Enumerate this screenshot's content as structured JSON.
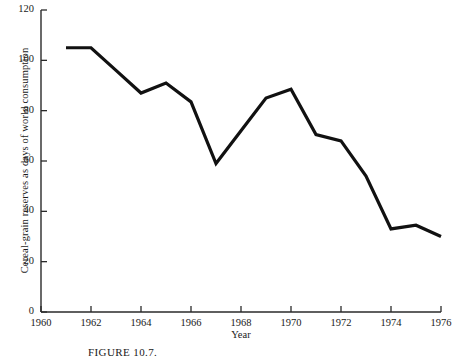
{
  "caption": "FIGURE 10.7.",
  "chart_data": {
    "type": "line",
    "title": "",
    "xlabel": "Year",
    "ylabel": "Cereal-grain reserves as days of world consumption",
    "xlim": [
      1960,
      1976
    ],
    "ylim": [
      0,
      120
    ],
    "grid": false,
    "legend": null,
    "xticks": [
      1960,
      1962,
      1964,
      1966,
      1968,
      1970,
      1972,
      1974,
      1976
    ],
    "xtick_labels": [
      "1960",
      "1962",
      "1964",
      "1966",
      "1968",
      "1970",
      "1972",
      "1974",
      "1976"
    ],
    "yticks": [
      0,
      20,
      40,
      60,
      80,
      100,
      120
    ],
    "ytick_labels": [
      "0",
      "20",
      "40",
      "60",
      "80",
      "100",
      "120"
    ],
    "line_color": "#111111",
    "line_width": 3.2,
    "x": [
      1961,
      1962,
      1963,
      1964,
      1965,
      1966,
      1967,
      1968,
      1969,
      1970,
      1971,
      1972,
      1973,
      1974,
      1975,
      1976
    ],
    "values": [
      105,
      105,
      96,
      87,
      91,
      83.5,
      59,
      72,
      85,
      88.5,
      70.5,
      68,
      54,
      33,
      34.5,
      30
    ],
    "series": [
      {
        "name": "Cereal-grain reserves",
        "x": [
          1961,
          1962,
          1963,
          1964,
          1965,
          1966,
          1967,
          1968,
          1969,
          1970,
          1971,
          1972,
          1973,
          1974,
          1975,
          1976
        ],
        "values": [
          105,
          105,
          96,
          87,
          91,
          83.5,
          59,
          72,
          85,
          88.5,
          70.5,
          68,
          54,
          33,
          34.5,
          30
        ]
      }
    ]
  }
}
